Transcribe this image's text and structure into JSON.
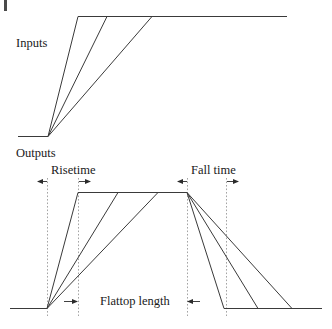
{
  "figure": {
    "labels": {
      "inputs": "Inputs",
      "outputs": "Outputs",
      "risetime": "Risetime",
      "fall_time": "Fall time",
      "flattop_length": "Flattop length"
    },
    "colors": {
      "waveform": "#3a3a3a",
      "guide": "#8d8d8d",
      "dimension": "#2b2b2b",
      "background": "#ffffff",
      "text": "#1a1a1a"
    },
    "top_panel": {
      "name": "input-waveform-panel",
      "baseline_y": 136,
      "plateau_y": 16,
      "origin_x": 48,
      "baseline_start_x": 18,
      "plateau_end_x": 287,
      "ramps": [
        {
          "name": "fast-rise-ramp",
          "corner_x": 78
        },
        {
          "name": "medium-rise-ramp",
          "corner_x": 107
        },
        {
          "name": "slow-rise-ramp",
          "corner_x": 152
        }
      ]
    },
    "bottom_panel": {
      "name": "output-waveform-panel",
      "baseline_y": 308,
      "plateau_y": 192,
      "origin_x": 47,
      "baseline_start_x": 10,
      "rise_corner_x": 78,
      "fall_start_x": 187,
      "baseline_end_x": 322,
      "rise_ramps": [
        {
          "name": "fast-rise-ramp",
          "corner_x": 78
        },
        {
          "name": "medium-rise-ramp",
          "corner_x": 118
        },
        {
          "name": "slow-rise-ramp",
          "corner_x": 158
        }
      ],
      "fall_ramps": [
        {
          "name": "fast-fall-ramp",
          "end_x": 224
        },
        {
          "name": "medium-fall-ramp",
          "end_x": 258
        },
        {
          "name": "slow-fall-ramp",
          "end_x": 292
        }
      ],
      "guides": [
        {
          "name": "rise-start-guide",
          "x": 47
        },
        {
          "name": "rise-end-guide",
          "x": 78
        },
        {
          "name": "fall-start-guide",
          "x": 187
        },
        {
          "name": "fall-end-guide",
          "x": 226
        }
      ],
      "dimensions": [
        {
          "name": "risetime-dimension",
          "label": "Risetime",
          "from_x": 47,
          "to_x": 78,
          "y": 181,
          "arrows": "outward"
        },
        {
          "name": "fall-time-dimension",
          "label": "Fall time",
          "from_x": 187,
          "to_x": 226,
          "y": 181,
          "arrows": "outward"
        },
        {
          "name": "flattop-length-dimension",
          "label": "Flattop length",
          "from_x": 78,
          "to_x": 187,
          "y": 301,
          "arrows": "inward"
        }
      ]
    }
  }
}
